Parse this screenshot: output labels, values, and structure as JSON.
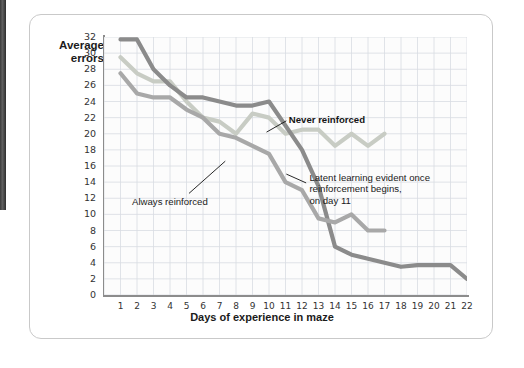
{
  "figure": {
    "y_axis_label": "Average\nerrors",
    "x_axis_title": "Days of experience in maze"
  },
  "annotations": {
    "never_reinforced": "Never reinforced",
    "always_reinforced": "Always reinforced",
    "latent_learning": "Latent learning evident once\nreinforcement begins,\non day 11"
  },
  "colors": {
    "never_reinforced": "#c8ccc4",
    "delayed_reinforced": "#a8a8a8",
    "always_reinforced": "#8b8b8b",
    "grid": "#d8dce2",
    "axis": "#8c8c8c",
    "card_border": "#c9c9c9",
    "plot_background": "#fcfcfc"
  },
  "chart_data": {
    "type": "line",
    "title": "",
    "xlabel": "Days of experience in maze",
    "ylabel": "Average errors",
    "xlim": [
      0,
      22
    ],
    "ylim": [
      0,
      32
    ],
    "ytick_step": 2,
    "grid": true,
    "legend": "annotations-on-plot",
    "x": [
      1,
      2,
      3,
      4,
      5,
      6,
      7,
      8,
      9,
      10,
      11,
      12,
      13,
      14,
      15,
      16,
      17,
      18,
      19,
      20,
      21,
      22
    ],
    "xtick_labels": [
      "1",
      "2",
      "3",
      "4",
      "5",
      "6",
      "7",
      "8",
      "9",
      "10",
      "11",
      "12",
      "13",
      "14",
      "15",
      "16",
      "17",
      "18",
      "19",
      "20",
      "21",
      "22"
    ],
    "ytick_labels": [
      "0",
      "2",
      "4",
      "6",
      "8",
      "10",
      "12",
      "14",
      "16",
      "18",
      "20",
      "22",
      "24",
      "26",
      "28",
      "30",
      "32"
    ],
    "series": [
      {
        "name": "Never reinforced",
        "color": "#c8ccc4",
        "x": [
          1,
          2,
          3,
          4,
          5,
          6,
          7,
          8,
          9,
          10,
          11,
          12,
          13,
          14,
          15,
          16,
          17
        ],
        "values": [
          29.5,
          27.5,
          26.5,
          26.5,
          24.0,
          22.0,
          21.5,
          20.0,
          22.5,
          22.0,
          20.0,
          20.5,
          20.5,
          18.5,
          20.0,
          18.5,
          20.0
        ]
      },
      {
        "name": "Always reinforced",
        "color": "#8b8b8b",
        "x": [
          1,
          2,
          3,
          4,
          5,
          6,
          7,
          8,
          9,
          10,
          11,
          12,
          13,
          14,
          15,
          16,
          17,
          18,
          19,
          20,
          21,
          22
        ],
        "values": [
          31.7,
          31.7,
          28.0,
          26.0,
          24.5,
          24.5,
          24.0,
          23.5,
          23.5,
          24.0,
          21.0,
          18.0,
          13.5,
          6.0,
          5.0,
          4.5,
          4.0,
          3.5,
          3.7,
          3.7,
          3.7,
          2.0
        ]
      },
      {
        "name": "Delayed reinforcement (latent learning)",
        "color": "#a8a8a8",
        "x": [
          1,
          2,
          3,
          4,
          5,
          6,
          7,
          8,
          9,
          10,
          11,
          12,
          13,
          14,
          15,
          16,
          17
        ],
        "values": [
          27.5,
          25.0,
          24.5,
          24.5,
          23.0,
          22.0,
          20.0,
          19.5,
          18.5,
          17.5,
          14.0,
          13.0,
          9.5,
          9.0,
          10.0,
          8.0,
          8.0
        ]
      }
    ],
    "annotations": [
      {
        "text": "Never reinforced",
        "target_x": 10,
        "target_y": 20.5
      },
      {
        "text": "Always reinforced",
        "target_x": 9,
        "target_y": 23.5
      },
      {
        "text": "Latent learning evident once reinforcement begins, on day 11",
        "target_x": 12,
        "target_y": 13.0
      }
    ]
  }
}
